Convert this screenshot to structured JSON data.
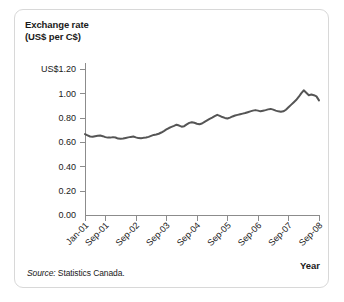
{
  "figure": {
    "title": "Exchange rate\n(US$ per C$)",
    "source_label": "Source:",
    "source_text": " Statistics Canada.",
    "year_axis_label": "Year"
  },
  "chart_data": {
    "type": "line",
    "title": "Exchange rate (US$ per C$)",
    "xlabel": "Year",
    "ylabel": "Exchange rate (US$ per C$)",
    "ylim": [
      0.0,
      1.2
    ],
    "grid": false,
    "legend": null,
    "line_color": "#555555",
    "axis_color": "#8c8c8c",
    "ytick_labels": [
      "US$1.20",
      "1.00",
      "0.80",
      "0.60",
      "0.40",
      "0.20",
      "0.00"
    ],
    "ytick_values": [
      1.2,
      1.0,
      0.8,
      0.6,
      0.4,
      0.2,
      0.0
    ],
    "xtick_labels": [
      "Jan-01",
      "Sep-01",
      "Sep-02",
      "Sep-03",
      "Sep-04",
      "Sep-05",
      "Sep-06",
      "Sep-07",
      "Sep-08"
    ],
    "xtick_positions": [
      0,
      8,
      20,
      32,
      44,
      56,
      68,
      80,
      92
    ],
    "x_index_count": 93,
    "series": [
      {
        "name": "US$ per C$",
        "values": [
          0.665,
          0.655,
          0.645,
          0.643,
          0.648,
          0.652,
          0.653,
          0.648,
          0.64,
          0.636,
          0.636,
          0.64,
          0.637,
          0.628,
          0.626,
          0.628,
          0.633,
          0.638,
          0.642,
          0.645,
          0.638,
          0.632,
          0.63,
          0.634,
          0.637,
          0.642,
          0.65,
          0.658,
          0.662,
          0.668,
          0.678,
          0.69,
          0.703,
          0.715,
          0.724,
          0.732,
          0.742,
          0.735,
          0.726,
          0.73,
          0.745,
          0.757,
          0.763,
          0.758,
          0.75,
          0.746,
          0.752,
          0.765,
          0.778,
          0.79,
          0.8,
          0.812,
          0.823,
          0.815,
          0.805,
          0.798,
          0.793,
          0.8,
          0.81,
          0.818,
          0.823,
          0.828,
          0.833,
          0.838,
          0.845,
          0.852,
          0.858,
          0.862,
          0.858,
          0.852,
          0.857,
          0.862,
          0.868,
          0.872,
          0.866,
          0.858,
          0.852,
          0.848,
          0.852,
          0.865,
          0.885,
          0.905,
          0.925,
          0.945,
          0.97,
          1.0,
          1.025,
          1.005,
          0.985,
          0.99,
          0.985,
          0.975,
          0.942
        ]
      }
    ]
  }
}
